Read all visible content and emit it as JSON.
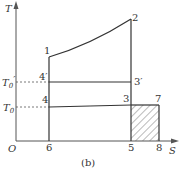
{
  "diagram": {
    "type": "T-S diagram",
    "caption": "(b)",
    "axes": {
      "y_label": "T",
      "x_label": "S",
      "origin_label": "O"
    },
    "temperature_levels": [
      {
        "label": "T",
        "subscript": "0",
        "prime": "′",
        "full": "T0′"
      },
      {
        "label": "T",
        "subscript": "0",
        "prime": "",
        "full": "T0"
      }
    ],
    "points": [
      {
        "id": "1",
        "label": "1"
      },
      {
        "id": "2",
        "label": "2"
      },
      {
        "id": "3p",
        "label": "3′"
      },
      {
        "id": "4p",
        "label": "4′"
      },
      {
        "id": "3",
        "label": "3"
      },
      {
        "id": "4",
        "label": "4"
      },
      {
        "id": "7",
        "label": "7"
      }
    ],
    "x_ticks": [
      {
        "label": "6"
      },
      {
        "label": "5"
      },
      {
        "label": "8"
      }
    ],
    "hatched_region": "3-7-8-5"
  }
}
